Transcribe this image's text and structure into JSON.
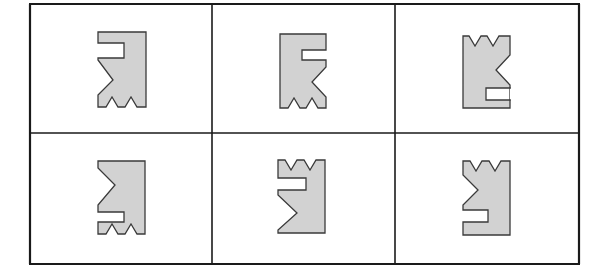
{
  "puzzle": {
    "rows": 2,
    "cols": 3,
    "colors": {
      "background": "#ffffff",
      "grid_line": "#1a1a1a",
      "shape_fill": "#d2d2d2",
      "shape_stroke": "#3a3a3a"
    },
    "grid": {
      "x": [
        30,
        212,
        395,
        579
      ],
      "y": [
        4,
        133,
        264
      ]
    },
    "cells": [
      {
        "id": "cell-1",
        "row": 0,
        "col": 0,
        "shape": "98,32 146,32 146,107 137,107 131,97 125,107 118,107 112,97 106,107 98,107 98,95 113,80 98,60 98,58 124,58 124,43 98,43"
      },
      {
        "id": "cell-2",
        "row": 0,
        "col": 1,
        "shape": "280,34 326,34 326,50 302,50 302,60 326,60 326,67 312,82 326,97 326,108 318,108 312,98 306,108 300,108 294,98 288,108 280,108"
      },
      {
        "id": "cell-3",
        "row": 0,
        "col": 2,
        "shape": "463,36 469,36 475,46 481,36 487,36 493,46 499,36 510,36 510,55 496,70 510,85 510,108 463,108 463,36",
        "notch": "510,88 486,88 486,100 510,100"
      },
      {
        "id": "cell-4",
        "row": 1,
        "col": 0,
        "shape": "98,161 145,161 145,234 137,234 131,224 125,234 118,234 112,224 106,234 98,234 98,222 124,222 124,212 98,212 98,205 115,185 98,168"
      },
      {
        "id": "cell-5",
        "row": 1,
        "col": 1,
        "shape": "278,160 285,160 291,170 297,160 304,160 310,170 316,160 325,160 325,233 278,233 278,230 297,213 278,195 278,190 306,190 306,178 278,178"
      },
      {
        "id": "cell-6",
        "row": 1,
        "col": 2,
        "shape": "463,161 470,161 476,171 482,161 489,161 495,171 501,161 510,161 510,235 463,235 463,222 488,222 488,210 463,210 463,205 478,190 463,175"
      }
    ]
  }
}
